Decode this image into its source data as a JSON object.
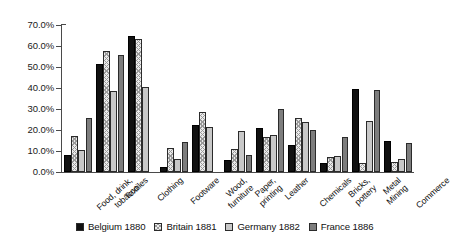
{
  "chart_data": {
    "type": "bar",
    "title": "",
    "xlabel": "",
    "ylabel": "",
    "ylim": [
      0,
      70
    ],
    "ytick_labels": [
      "70.0%",
      "60.0%",
      "50.0%",
      "40.0%",
      "30.0%",
      "20.0%",
      "10.0%",
      "0.0%"
    ],
    "ytick_values": [
      70,
      60,
      50,
      40,
      30,
      20,
      10,
      0
    ],
    "grid": false,
    "legend_position": "bottom",
    "categories": [
      "Food, drink, tobacco",
      "Textiles",
      "Clothing",
      "Footware",
      "Wood, furniture",
      "Paper, printing",
      "Leather",
      "Chemicals",
      "Bricks, pottery",
      "Metal Mining",
      "Commerce"
    ],
    "category_lines": [
      [
        "Food, drink,",
        "tobacco"
      ],
      [
        "Textiles"
      ],
      [
        "Clothing"
      ],
      [
        "Footware"
      ],
      [
        "Wood,",
        "furniture"
      ],
      [
        "Paper,",
        "printing"
      ],
      [
        "Leather"
      ],
      [
        "Chemicals"
      ],
      [
        "Bricks,",
        "pottery"
      ],
      [
        "Metal",
        "Mining"
      ],
      [
        "Commerce"
      ]
    ],
    "series": [
      {
        "name": "Belgium 1880",
        "color": "#111111",
        "pattern": "solid-black",
        "values": [
          8.0,
          51.5,
          65.0,
          2.5,
          22.5,
          5.5,
          21.0,
          13.0,
          4.5,
          39.5,
          15.0
        ]
      },
      {
        "name": "Britain 1881",
        "color": "#ececec",
        "pattern": "crosshatch",
        "values": [
          17.0,
          57.5,
          63.5,
          11.5,
          28.5,
          11.0,
          16.5,
          25.5,
          7.0,
          4.5,
          5.0
        ]
      },
      {
        "name": "Germany 1882",
        "color": "#c8c8c8",
        "pattern": "solid-light-grey",
        "values": [
          10.5,
          38.5,
          40.5,
          6.0,
          21.5,
          19.5,
          17.5,
          24.0,
          7.5,
          24.5,
          6.0
        ]
      },
      {
        "name": "France 1886",
        "color": "#7d7d7d",
        "pattern": "solid-dark-grey",
        "values": [
          25.5,
          55.5,
          0.0,
          14.5,
          0.0,
          8.0,
          30.0,
          20.0,
          16.5,
          39.0,
          14.0
        ]
      }
    ]
  },
  "legend": {
    "items": [
      {
        "label": "Belgium 1880"
      },
      {
        "label": "Britain 1881"
      },
      {
        "label": "Germany 1882"
      },
      {
        "label": "France 1886"
      }
    ]
  }
}
